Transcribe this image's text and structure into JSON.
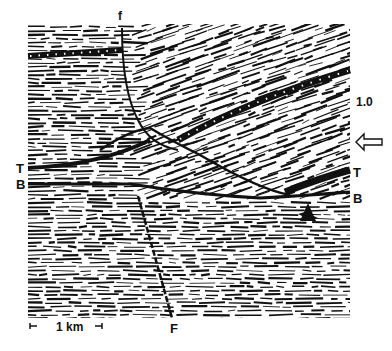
{
  "figure": {
    "type": "seismic-section",
    "labels": {
      "fault_upper": "f",
      "fault_lower": "F",
      "horizon_T_left": "T",
      "horizon_B_left": "B",
      "horizon_T_right": "T",
      "horizon_B_right": "B",
      "time_tick": "1.0",
      "scale_bar": "1 km",
      "arrow_marker": "arrow-left-icon",
      "triangle_marker": "triangle-icon"
    },
    "colors": {
      "ink": "#111111",
      "paper": "#ffffff"
    }
  }
}
